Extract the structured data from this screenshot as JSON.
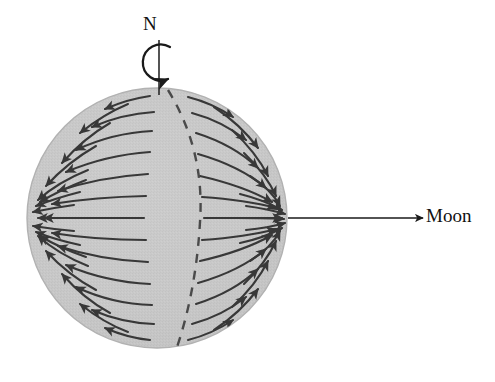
{
  "diagram": {
    "type": "vector-field-sphere",
    "background_color": "#ffffff",
    "labels": {
      "north_pole": "N",
      "moon": "Moon"
    },
    "sphere": {
      "name": "earth-sphere",
      "center_x": 157,
      "center_y": 218,
      "radius": 130,
      "fill_color": "#c6c6c6",
      "edge_color": "#b0b0b0",
      "texture": "halftone-dither"
    },
    "rotation_axis": {
      "name": "polar-axis",
      "x": 159,
      "y_top": 40,
      "y_bottom": 92,
      "color": "#2a2a2a"
    },
    "rotation_arrow": {
      "name": "rotation-direction-arrow",
      "shape": "open-circular-arc",
      "opening": "right",
      "center_x": 159,
      "center_y": 63,
      "radius": 18,
      "color": "#1a1a1a",
      "direction": "counterclockwise-viewed-from-north"
    },
    "moon_pointer": {
      "name": "moon-direction-arrow",
      "x_start": 288,
      "x_end": 425,
      "y": 218,
      "color": "#1a1a1a"
    },
    "terminator": {
      "name": "dashed-meridian",
      "style": "dashed",
      "color": "#4a4a4a",
      "description": "meridian 90 degrees from the sub-lunar point separating opposing tidal flow directions"
    },
    "focal_points": [
      {
        "name": "sub-lunar-point",
        "x": 287,
        "y": 218,
        "convergence": "inward"
      },
      {
        "name": "antipodal-point",
        "x": 30,
        "y": 232,
        "convergence": "inward"
      }
    ],
    "arrow_color": "#383838",
    "field_description": "Tidal acceleration vectors converge toward the sub-lunar point on the right limb and toward the antipodal point on the left limb."
  }
}
